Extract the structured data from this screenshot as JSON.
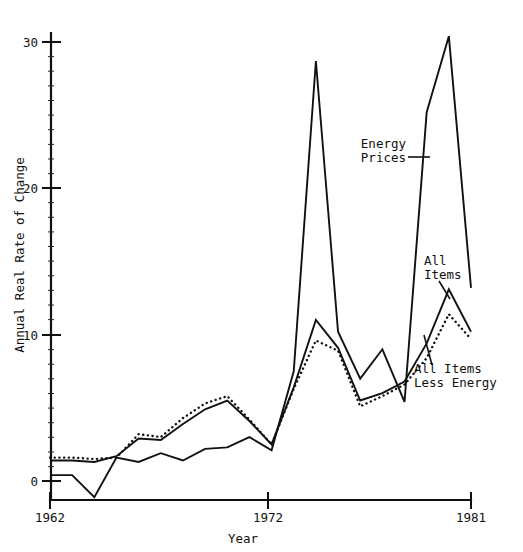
{
  "chart_data": {
    "type": "line",
    "title": "",
    "subtitle": "",
    "xlabel": "Year",
    "ylabel": "Annual Real Rate of Change",
    "xlim": [
      1962,
      1981
    ],
    "ylim": [
      -2,
      31
    ],
    "grid": false,
    "legend_position": "inline-annotations",
    "x_ticks": [
      "1962",
      "1972",
      "1981"
    ],
    "x_tick_values": [
      1962,
      1972,
      1981
    ],
    "y_ticks": [
      "0",
      "10",
      "20",
      "30"
    ],
    "y_tick_values": [
      0,
      10,
      20,
      30
    ],
    "x": [
      1962,
      1963,
      1964,
      1965,
      1966,
      1967,
      1968,
      1969,
      1970,
      1971,
      1972,
      1973,
      1974,
      1975,
      1976,
      1977,
      1978,
      1979,
      1980,
      1981
    ],
    "series": [
      {
        "name": "Energy Prices",
        "style": "solid",
        "values": [
          0.4,
          0.4,
          -1.1,
          1.6,
          1.3,
          1.9,
          1.4,
          2.2,
          2.3,
          3.0,
          2.1,
          7.5,
          28.7,
          10.2,
          7.0,
          9.0,
          5.4,
          25.2,
          30.4,
          13.2
        ]
      },
      {
        "name": "All Items",
        "style": "solid",
        "values": [
          1.4,
          1.4,
          1.3,
          1.7,
          2.9,
          2.8,
          3.9,
          4.9,
          5.5,
          4.1,
          2.5,
          6.4,
          11.0,
          9.1,
          5.5,
          6.0,
          6.8,
          9.4,
          13.1,
          10.2
        ]
      },
      {
        "name": "All Items Less Energy",
        "style": "dotted",
        "values": [
          1.6,
          1.6,
          1.5,
          1.6,
          3.2,
          3.0,
          4.3,
          5.3,
          5.8,
          4.2,
          2.5,
          6.3,
          9.6,
          8.9,
          5.1,
          5.8,
          6.6,
          8.4,
          11.4,
          9.7
        ]
      }
    ],
    "annotations": [
      {
        "label_line1": "Energy",
        "label_line2": "Prices"
      },
      {
        "label_line1": "All",
        "label_line2": "Items"
      },
      {
        "label_line1": "All Items",
        "label_line2": "Less Energy"
      }
    ]
  },
  "axes": {
    "y_title": "Annual Real Rate of Change",
    "x_title": "Year",
    "y_tick_0": "0",
    "y_tick_10": "10",
    "y_tick_20": "20",
    "y_tick_30": "30",
    "x_tick_start": "1962",
    "x_tick_mid": "1972",
    "x_tick_end": "1981"
  },
  "labels": {
    "energy_line1": "Energy",
    "energy_line2": "Prices",
    "all_items_line1": "All",
    "all_items_line2": "Items",
    "less_energy_line1": "All Items",
    "less_energy_line2": "Less Energy"
  },
  "colors": {
    "ink": "#111111",
    "background": "#ffffff"
  }
}
